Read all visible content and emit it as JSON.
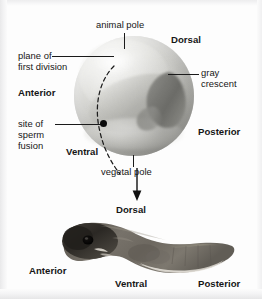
{
  "figure": {
    "background_color": "#fdfdfd",
    "text_color": "#161616",
    "leader_line_color": "#1a1a1a"
  },
  "egg_panel": {
    "name": "frog-egg-diagram",
    "labels": {
      "animal_pole": "animal pole",
      "dorsal": "Dorsal",
      "plane_of_first_division_line1": "plane of",
      "plane_of_first_division_line2": "first division",
      "anterior": "Anterior",
      "gray_crescent_line1": "gray",
      "gray_crescent_line2": "crescent",
      "posterior": "Posterior",
      "site_of_sperm_fusion_line1": "site of",
      "site_of_sperm_fusion_line2": "sperm",
      "site_of_sperm_fusion_line3": "fusion",
      "ventral": "Ventral",
      "vegetal_pole": "vegetal pole"
    },
    "features": {
      "sperm_fusion_marker": "black-dot",
      "first_division_plane": "dashed-arc",
      "gray_crescent_color": "#5d5d59",
      "egg_base_color": "#cfcfcb"
    }
  },
  "connector": {
    "name": "develops-into-arrow",
    "direction": "down"
  },
  "embryo_panel": {
    "name": "tadpole-embryo-photo",
    "labels": {
      "dorsal": "Dorsal",
      "anterior": "Anterior",
      "ventral": "Ventral",
      "posterior": "Posterior"
    },
    "features": {
      "body_color": "#6b6760",
      "head_color": "#2e2b27",
      "belly_color": "#d8d4cc"
    }
  }
}
